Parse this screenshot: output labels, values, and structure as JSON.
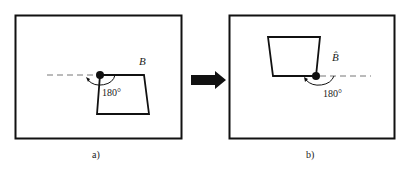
{
  "panels": [
    {
      "caption": "a)",
      "label": "B",
      "angle": "180°"
    },
    {
      "caption": "b)",
      "label": "B̂",
      "angle": "180°"
    }
  ],
  "colors": {
    "stroke": "#111111",
    "background": "#ffffff",
    "dashed": "#777777"
  }
}
